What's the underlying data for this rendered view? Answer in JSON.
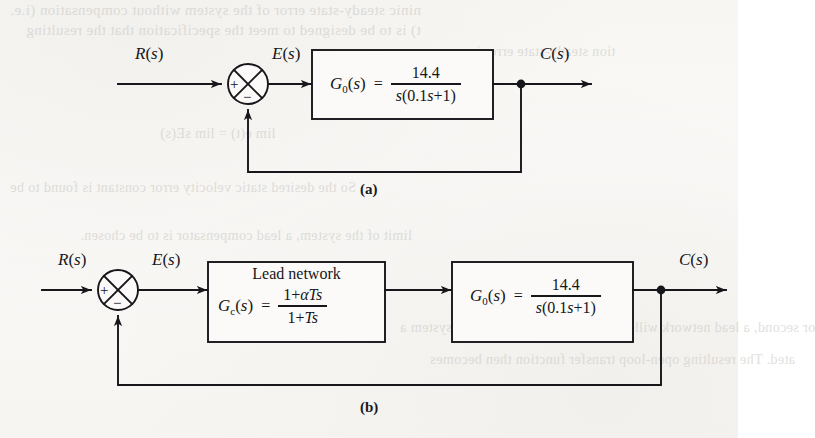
{
  "figure": {
    "type": "control-system-block-diagram",
    "background_color": "#f8f7f4",
    "ink_color": "#17161a"
  },
  "bleed_text": {
    "line1": "ninic steady-state error of the system without compensation (i.e.",
    "line2": "t) is to be designed to meet the specification that the resulting",
    "line3": "tion steady-state error is",
    "line4": "lim e(t) = lim sE(s)",
    "line5": "So the desired static velocity error constant is found to be",
    "line6": "limit of the system, a lead compensator is to be chosen.",
    "line7": "or second, a lead network will be cascaded with the original system a",
    "line8": "ated. The resulting open-loop transfer function then becomes"
  },
  "diagram_a": {
    "caption": "(a)",
    "input_label": {
      "var": "R",
      "arg": "s"
    },
    "error_label": {
      "var": "E",
      "arg": "s"
    },
    "output_label": {
      "var": "C",
      "arg": "s"
    },
    "summing_junction": {
      "name": "summing-junction",
      "positive_sign": "+",
      "negative_sign": "−"
    },
    "plant_block": {
      "name": "G0",
      "function_label": {
        "var": "G",
        "sub": "0",
        "arg": "s"
      },
      "equals": "=",
      "numerator": "14.4",
      "denominator": "s(0.1s+1)",
      "expression": "G_0(s) = 14.4 / [s(0.1s+1)]"
    }
  },
  "diagram_b": {
    "caption": "(b)",
    "input_label": {
      "var": "R",
      "arg": "s"
    },
    "error_label": {
      "var": "E",
      "arg": "s"
    },
    "output_label": {
      "var": "C",
      "arg": "s"
    },
    "summing_junction": {
      "name": "summing-junction",
      "positive_sign": "+",
      "negative_sign": "−"
    },
    "compensator_block": {
      "title": "Lead network",
      "function_label": {
        "var": "G",
        "sub": "c",
        "arg": "s"
      },
      "equals": "=",
      "numerator": "1+αTs",
      "denominator": "1+Ts",
      "expression": "G_c(s) = (1 + alpha*T*s) / (1 + T*s)"
    },
    "plant_block": {
      "name": "G0",
      "function_label": {
        "var": "G",
        "sub": "0",
        "arg": "s"
      },
      "equals": "=",
      "numerator": "14.4",
      "denominator": "s(0.1s+1)",
      "expression": "G_0(s) = 14.4 / [s(0.1s+1)]"
    }
  }
}
